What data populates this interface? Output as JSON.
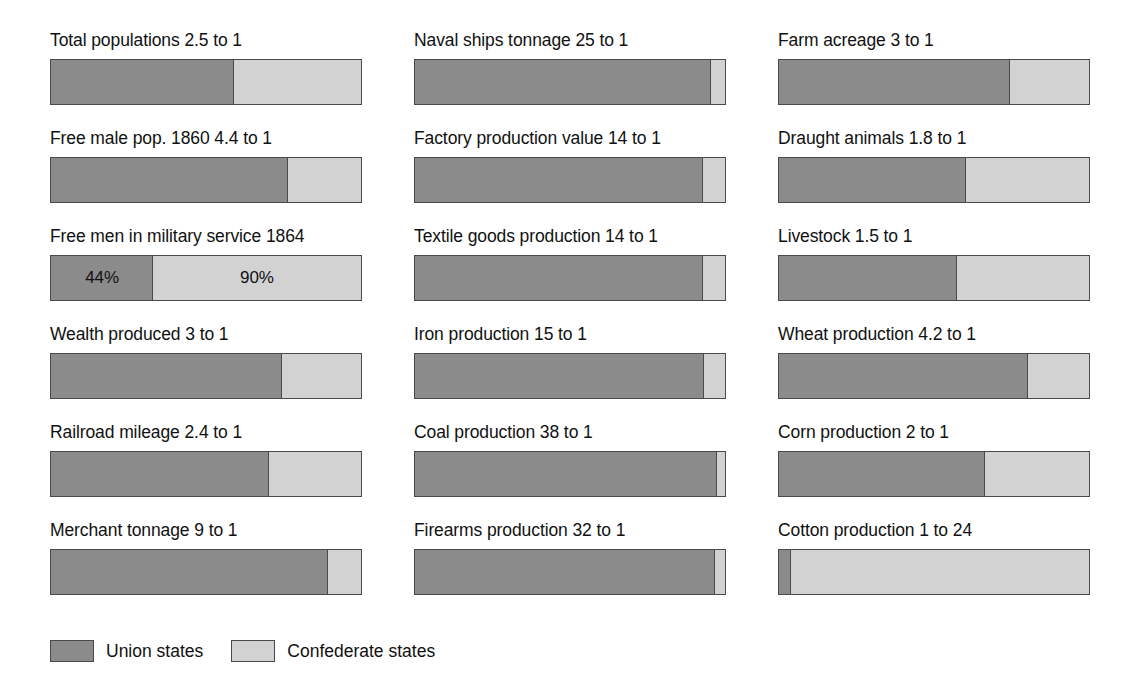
{
  "chart_data": {
    "type": "bar",
    "title": "",
    "subtitle": "",
    "xlabel": "",
    "ylabel": "",
    "orientation": "horizontal-stacked",
    "grid": false,
    "legend_position": "bottom-left",
    "series": [
      {
        "name": "Union states",
        "color": "#8b8b8b"
      },
      {
        "name": "Confederate states",
        "color": "#d2d2d2"
      }
    ],
    "categories": [
      "Total populations 2.5 to 1",
      "Free male pop. 1860 4.4 to 1",
      "Free men in military service 1864",
      "Wealth produced 3 to 1",
      "Railroad mileage 2.4 to 1",
      "Merchant tonnage 9 to 1",
      "Naval ships tonnage 25 to 1",
      "Factory production value 14 to 1",
      "Textile goods production 14 to 1",
      "Iron production 15 to 1",
      "Coal production 38 to 1",
      "Firearms production 32 to 1",
      "Farm acreage 3 to 1",
      "Draught animals 1.8 to 1",
      "Livestock 1.5 to 1",
      "Wheat production 4.2 to 1",
      "Corn production 2 to 1",
      "Cotton production 1 to 24"
    ],
    "union_percent": [
      71.4,
      81.5,
      33.0,
      75.0,
      70.6,
      90.0,
      96.2,
      93.3,
      93.3,
      93.8,
      97.4,
      97.0,
      75.0,
      64.3,
      60.0,
      80.8,
      66.7,
      4.0
    ],
    "confederate_percent": [
      28.6,
      18.5,
      67.0,
      25.0,
      29.4,
      10.0,
      3.8,
      6.7,
      6.7,
      6.2,
      2.6,
      3.0,
      25.0,
      35.7,
      40.0,
      19.2,
      33.3,
      96.0
    ]
  },
  "columns": [
    {
      "bars": [
        {
          "label": "Total populations 2.5 to 1",
          "union_pct": 59.0,
          "conf_pct": 41.0,
          "union_value": "",
          "conf_value": ""
        },
        {
          "label": "Free male pop. 1860 4.4 to 1",
          "union_pct": 76.5,
          "conf_pct": 23.5,
          "union_value": "",
          "conf_value": ""
        },
        {
          "label": "Free men in military service 1864",
          "union_pct": 33.0,
          "conf_pct": 67.0,
          "union_value": "44%",
          "conf_value": "90%"
        },
        {
          "label": "Wealth produced 3 to 1",
          "union_pct": 74.5,
          "conf_pct": 25.5,
          "union_value": "",
          "conf_value": ""
        },
        {
          "label": "Railroad mileage 2.4 to 1",
          "union_pct": 70.5,
          "conf_pct": 29.5,
          "union_value": "",
          "conf_value": ""
        },
        {
          "label": "Merchant tonnage 9 to 1",
          "union_pct": 89.5,
          "conf_pct": 10.5,
          "union_value": "",
          "conf_value": ""
        }
      ]
    },
    {
      "bars": [
        {
          "label": "Naval ships tonnage 25 to 1",
          "union_pct": 95.5,
          "conf_pct": 4.5,
          "union_value": "",
          "conf_value": ""
        },
        {
          "label": "Factory production value 14 to 1",
          "union_pct": 93.0,
          "conf_pct": 7.0,
          "union_value": "",
          "conf_value": ""
        },
        {
          "label": "Textile goods production 14 to 1",
          "union_pct": 93.0,
          "conf_pct": 7.0,
          "union_value": "",
          "conf_value": ""
        },
        {
          "label": "Iron production 15 to 1",
          "union_pct": 93.5,
          "conf_pct": 6.5,
          "union_value": "",
          "conf_value": ""
        },
        {
          "label": "Coal production 38 to 1",
          "union_pct": 97.5,
          "conf_pct": 2.5,
          "union_value": "",
          "conf_value": ""
        },
        {
          "label": "Firearms production 32 to 1",
          "union_pct": 97.0,
          "conf_pct": 3.0,
          "union_value": "",
          "conf_value": ""
        }
      ]
    },
    {
      "bars": [
        {
          "label": "Farm acreage 3 to 1",
          "union_pct": 74.5,
          "conf_pct": 25.5,
          "union_value": "",
          "conf_value": ""
        },
        {
          "label": "Draught animals 1.8 to 1",
          "union_pct": 60.5,
          "conf_pct": 39.5,
          "union_value": "",
          "conf_value": ""
        },
        {
          "label": "Livestock 1.5 to 1",
          "union_pct": 57.5,
          "conf_pct": 42.5,
          "union_value": "",
          "conf_value": ""
        },
        {
          "label": "Wheat production 4.2 to 1",
          "union_pct": 80.5,
          "conf_pct": 19.5,
          "union_value": "",
          "conf_value": ""
        },
        {
          "label": "Corn production 2 to 1",
          "union_pct": 66.5,
          "conf_pct": 33.5,
          "union_value": "",
          "conf_value": ""
        },
        {
          "label": "Cotton production 1 to 24",
          "union_pct": 4.0,
          "conf_pct": 96.0,
          "union_value": "",
          "conf_value": ""
        }
      ]
    }
  ],
  "legend": {
    "items": [
      {
        "label": "Union states",
        "swatch": "union"
      },
      {
        "label": "Confederate states",
        "swatch": "conf"
      }
    ]
  }
}
